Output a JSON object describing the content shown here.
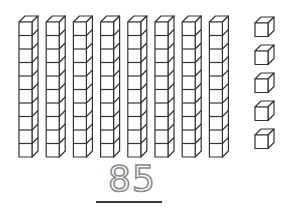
{
  "diagram": {
    "tens_rods": {
      "count": 8,
      "cubes_per_rod": 10
    },
    "ones_cubes": {
      "count": 5
    },
    "number_label": "85",
    "colors": {
      "stroke": "#333333",
      "fill": "#ffffff",
      "number": "#8a8a8a",
      "underline": "#3a3a3a"
    }
  }
}
